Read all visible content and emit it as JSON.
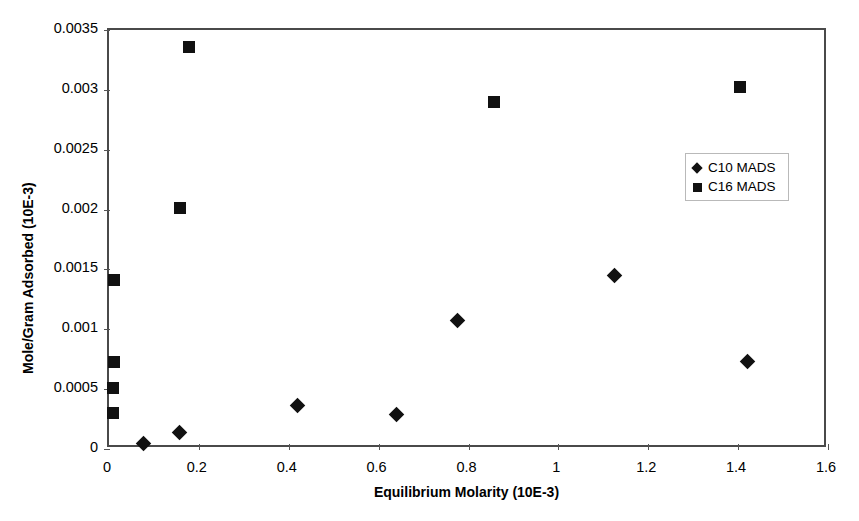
{
  "chart_data": {
    "type": "scatter",
    "title": "",
    "xlabel": "Equilibrium Molarity (10E-3)",
    "ylabel": "Mole/Gram Adsorbed (10E-3)",
    "xlim": [
      0,
      1.6
    ],
    "ylim": [
      0,
      0.0035
    ],
    "xticks": [
      "0",
      "0.2",
      "0.4",
      "0.6",
      "0.8",
      "1",
      "1.2",
      "1.4",
      "1.6"
    ],
    "xtick_values": [
      0,
      0.2,
      0.4,
      0.6,
      0.8,
      1,
      1.2,
      1.4,
      1.6
    ],
    "yticks": [
      "0",
      "0.0005",
      "0.001",
      "0.0015",
      "0.002",
      "0.0025",
      "0.003",
      "0.0035"
    ],
    "ytick_values": [
      0,
      0.0005,
      0.001,
      0.0015,
      0.002,
      0.0025,
      0.003,
      0.0035
    ],
    "grid": false,
    "legend_position": "upper-right-inside",
    "marker_color": "#111111",
    "axis_color": "#4a4a4a",
    "series": [
      {
        "name": "C10 MADS",
        "marker": "diamond",
        "points": [
          {
            "x": 0.076,
            "y": 5e-05
          },
          {
            "x": 0.156,
            "y": 0.00014
          },
          {
            "x": 0.42,
            "y": 0.00036
          },
          {
            "x": 0.64,
            "y": 0.00029
          },
          {
            "x": 0.775,
            "y": 0.00107
          },
          {
            "x": 1.125,
            "y": 0.00145
          },
          {
            "x": 1.42,
            "y": 0.00073
          }
        ]
      },
      {
        "name": "C16 MADS",
        "marker": "square",
        "points": [
          {
            "x": 0.01,
            "y": 0.0003
          },
          {
            "x": 0.01,
            "y": 0.00051
          },
          {
            "x": 0.012,
            "y": 0.00073
          },
          {
            "x": 0.012,
            "y": 0.00141
          },
          {
            "x": 0.158,
            "y": 0.00201
          },
          {
            "x": 0.178,
            "y": 0.00336
          },
          {
            "x": 0.857,
            "y": 0.0029
          },
          {
            "x": 1.404,
            "y": 0.00302
          }
        ]
      }
    ]
  },
  "legend": {
    "entries": [
      {
        "label": "C10 MADS",
        "marker": "diamond"
      },
      {
        "label": "C16 MADS",
        "marker": "square"
      }
    ]
  }
}
